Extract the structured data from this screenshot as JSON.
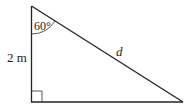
{
  "diagram": {
    "type": "right-triangle",
    "angle_label": "60°",
    "vertical_side_label": "2 m",
    "hypotenuse_label": "d",
    "colors": {
      "stroke": "#222222",
      "background": "#ffffff"
    }
  }
}
